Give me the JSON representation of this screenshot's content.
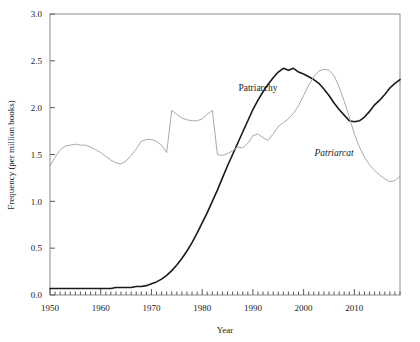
{
  "chart_data": {
    "type": "line",
    "title": "",
    "xlabel": "Year",
    "ylabel": "Frequency (per million books)",
    "xlim": [
      1950,
      2019
    ],
    "ylim": [
      0.0,
      3.0
    ],
    "grid": false,
    "legend_position": "inline-annotations",
    "xticks": [
      1950,
      1960,
      1970,
      1980,
      1990,
      2000,
      2010
    ],
    "xtick_labels": [
      "1950",
      "1960",
      "1970",
      "1980",
      "1990",
      "2000",
      "2010"
    ],
    "minor_xtick_interval": 1,
    "yticks": [
      0.0,
      0.5,
      1.0,
      1.5,
      2.0,
      2.5,
      3.0
    ],
    "ytick_labels": [
      "0.0",
      "0.5",
      "1.0",
      "1.5",
      "2.0",
      "2.5",
      "3.0"
    ],
    "series": [
      {
        "name": "Patriarchy",
        "color": "#1a1a1a",
        "style": "solid-upright",
        "label_x": 1991,
        "label_y": 2.18,
        "x": [
          1950,
          1951,
          1952,
          1953,
          1954,
          1955,
          1956,
          1957,
          1958,
          1959,
          1960,
          1961,
          1962,
          1963,
          1964,
          1965,
          1966,
          1967,
          1968,
          1969,
          1970,
          1971,
          1972,
          1973,
          1974,
          1975,
          1976,
          1977,
          1978,
          1979,
          1980,
          1981,
          1982,
          1983,
          1984,
          1985,
          1986,
          1987,
          1988,
          1989,
          1990,
          1991,
          1992,
          1993,
          1994,
          1995,
          1996,
          1997,
          1998,
          1999,
          2000,
          2001,
          2002,
          2003,
          2004,
          2005,
          2006,
          2007,
          2008,
          2009,
          2010,
          2011,
          2012,
          2013,
          2014,
          2015,
          2016,
          2017,
          2018,
          2019
        ],
        "y": [
          0.07,
          0.07,
          0.07,
          0.07,
          0.07,
          0.07,
          0.07,
          0.07,
          0.07,
          0.07,
          0.07,
          0.07,
          0.07,
          0.08,
          0.08,
          0.08,
          0.08,
          0.09,
          0.09,
          0.1,
          0.12,
          0.14,
          0.17,
          0.21,
          0.26,
          0.32,
          0.39,
          0.47,
          0.56,
          0.66,
          0.77,
          0.88,
          1.0,
          1.12,
          1.25,
          1.38,
          1.5,
          1.62,
          1.74,
          1.86,
          1.98,
          2.08,
          2.17,
          2.25,
          2.32,
          2.38,
          2.42,
          2.4,
          2.42,
          2.38,
          2.36,
          2.33,
          2.3,
          2.26,
          2.2,
          2.13,
          2.05,
          1.98,
          1.92,
          1.86,
          1.85,
          1.86,
          1.9,
          1.96,
          2.03,
          2.08,
          2.14,
          2.21,
          2.26,
          2.3
        ]
      },
      {
        "name": "Patriarcat",
        "color": "#aaaaaa",
        "style": "solid-italic",
        "label_x": 2006,
        "label_y": 1.48,
        "x": [
          1950,
          1951,
          1952,
          1953,
          1954,
          1955,
          1956,
          1957,
          1958,
          1959,
          1960,
          1961,
          1962,
          1963,
          1964,
          1965,
          1966,
          1967,
          1968,
          1969,
          1970,
          1971,
          1972,
          1973,
          1974,
          1975,
          1976,
          1977,
          1978,
          1979,
          1980,
          1981,
          1982,
          1983,
          1984,
          1985,
          1986,
          1987,
          1988,
          1989,
          1990,
          1991,
          1992,
          1993,
          1994,
          1995,
          1996,
          1997,
          1998,
          1999,
          2000,
          2001,
          2002,
          2003,
          2004,
          2005,
          2006,
          2007,
          2008,
          2009,
          2010,
          2011,
          2012,
          2013,
          2014,
          2015,
          2016,
          2017,
          2018,
          2019
        ],
        "y": [
          1.38,
          1.47,
          1.55,
          1.59,
          1.6,
          1.61,
          1.6,
          1.6,
          1.58,
          1.55,
          1.52,
          1.48,
          1.44,
          1.41,
          1.4,
          1.43,
          1.49,
          1.56,
          1.64,
          1.66,
          1.66,
          1.64,
          1.6,
          1.52,
          1.97,
          1.93,
          1.89,
          1.87,
          1.86,
          1.86,
          1.88,
          1.93,
          1.97,
          1.5,
          1.49,
          1.51,
          1.54,
          1.58,
          1.57,
          1.62,
          1.7,
          1.72,
          1.68,
          1.65,
          1.72,
          1.8,
          1.84,
          1.88,
          1.94,
          2.02,
          2.13,
          2.24,
          2.33,
          2.39,
          2.41,
          2.4,
          2.34,
          2.22,
          2.07,
          1.9,
          1.72,
          1.58,
          1.47,
          1.39,
          1.33,
          1.28,
          1.24,
          1.21,
          1.22,
          1.27
        ]
      }
    ]
  },
  "axis": {
    "y_label": "Frequency (per million books)",
    "x_label": "Year"
  }
}
